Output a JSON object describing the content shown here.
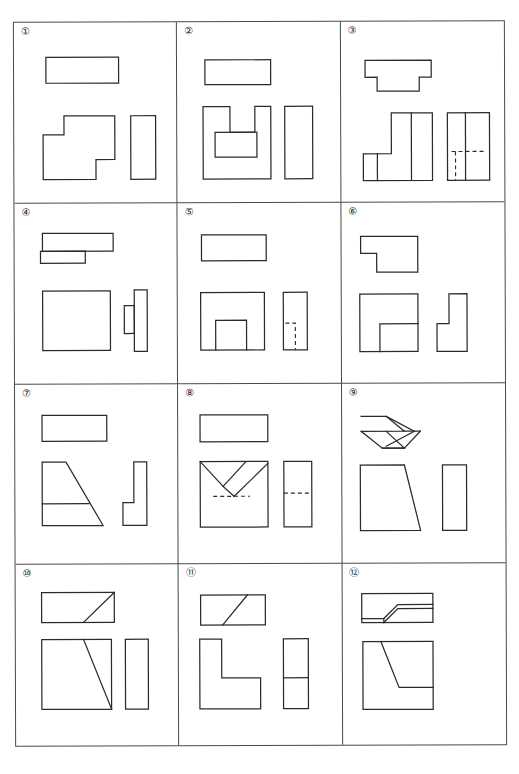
{
  "sheet": {
    "title": "",
    "grid": {
      "columns": 3,
      "rows": 4,
      "total_cells": 12
    }
  },
  "cells": [
    {
      "number": "①",
      "name": "exercise-1",
      "views": [
        "top-view",
        "front-view",
        "side-view"
      ],
      "description": "Top view plain rectangle; front view stepped block with notch; right side view tall rectangle"
    },
    {
      "number": "②",
      "name": "exercise-2",
      "views": [
        "top-view",
        "front-view",
        "side-view"
      ],
      "description": "Top view plain rectangle; front view U-channel with inner rectangular slot; right side view tall rectangle"
    },
    {
      "number": "③",
      "name": "exercise-3",
      "views": [
        "top-view",
        "front-view",
        "side-view"
      ],
      "description": "Top view T-shaped outline; front view L-block with vertical division line; side view rectangle with hidden dashed lines"
    },
    {
      "number": "④",
      "name": "exercise-4",
      "views": [
        "top-view",
        "front-view",
        "side-view"
      ],
      "description": "Top view two offset rectangles; front view large square; side view T-shape lying on side"
    },
    {
      "number": "⑤",
      "name": "exercise-5",
      "views": [
        "top-view",
        "front-view",
        "side-view"
      ],
      "description": "Top view plain rectangle; front view square with raised centre boss; side view rectangle with hidden dashed slot"
    },
    {
      "number": "⑥",
      "name": "exercise-6",
      "views": [
        "top-view",
        "front-view",
        "side-view"
      ],
      "description": "Top view L-shape; front view square divided into blocks; side view L-shape"
    },
    {
      "number": "⑦",
      "name": "exercise-7",
      "views": [
        "top-view",
        "front-view",
        "side-view"
      ],
      "description": "Top view plain rectangle; front view trapezoid with horizontal division; side view L-shape"
    },
    {
      "number": "⑧",
      "name": "exercise-8",
      "views": [
        "top-view",
        "front-view",
        "side-view"
      ],
      "description": "Top view plain rectangle; front view square with V-groove and hidden dashed lines; side view rectangle with hidden dashed line"
    },
    {
      "number": "⑨",
      "name": "exercise-9",
      "views": [
        "top-view",
        "front-view",
        "side-view"
      ],
      "description": "Top view double chevron arrow shape; front view trapezoid; side view narrow rectangle"
    },
    {
      "number": "⑩",
      "name": "exercise-10",
      "views": [
        "top-view",
        "front-view",
        "side-view"
      ],
      "description": "Top view rectangle with diagonal; front view square with long diagonal; side view narrow rectangle"
    },
    {
      "number": "⑪",
      "name": "exercise-11",
      "views": [
        "top-view",
        "front-view",
        "side-view"
      ],
      "description": "Top view rectangle with diagonal; front view L-shape; side view rectangle split horizontally"
    },
    {
      "number": "⑫",
      "name": "exercise-12",
      "views": [
        "top-view",
        "front-view",
        "side-view"
      ],
      "description": "Top view rectangle with parallelogram band; front view square with angled cut; side view narrow rectangle"
    }
  ],
  "style": {
    "line_color": "#2b2b2b",
    "border_color": "#4a4a4a",
    "background": "#ffffff"
  }
}
